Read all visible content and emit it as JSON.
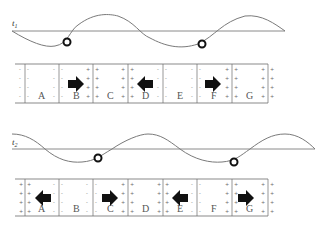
{
  "figure": {
    "panels": [
      {
        "id": "t1",
        "time_label": "t",
        "time_subscript": "1",
        "cells": [
          {
            "label": "A",
            "arrow": "none"
          },
          {
            "label": "B",
            "arrow": "right"
          },
          {
            "label": "C",
            "arrow": "none"
          },
          {
            "label": "D",
            "arrow": "left"
          },
          {
            "label": "E",
            "arrow": "none"
          },
          {
            "label": "F",
            "arrow": "right"
          },
          {
            "label": "G",
            "arrow": "none"
          }
        ],
        "particles": 2
      },
      {
        "id": "t2",
        "time_label": "t",
        "time_subscript": "2",
        "cells": [
          {
            "label": "A",
            "arrow": "left"
          },
          {
            "label": "B",
            "arrow": "none"
          },
          {
            "label": "C",
            "arrow": "right"
          },
          {
            "label": "D",
            "arrow": "none"
          },
          {
            "label": "E",
            "arrow": "left"
          },
          {
            "label": "F",
            "arrow": "none"
          },
          {
            "label": "G",
            "arrow": "right"
          }
        ],
        "particles": 2
      }
    ],
    "colors": {
      "line": "#8a8a8a",
      "arrow": "#111111",
      "ball_stroke": "#111111"
    }
  }
}
